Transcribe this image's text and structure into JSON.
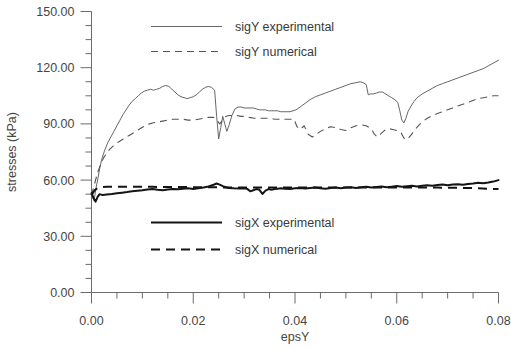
{
  "chart_data": {
    "type": "line",
    "title": "",
    "xlabel": "epsY",
    "ylabel": "stresses (kPa)",
    "xlim": [
      0.0,
      0.08
    ],
    "ylim": [
      0.0,
      150.0
    ],
    "grid": false,
    "legend_position": "inside-upper-left and inside-middle-left",
    "xticks": [
      "0.00",
      "0.02",
      "0.04",
      "0.06",
      "0.08"
    ],
    "xtick_values": [
      0.0,
      0.02,
      0.04,
      0.06,
      0.08
    ],
    "xminor_interval": 0.005,
    "yticks": [
      "0.00",
      "30.00",
      "60.00",
      "90.00",
      "120.00",
      "150.00"
    ],
    "ytick_values": [
      0,
      30,
      60,
      90,
      120,
      150
    ],
    "yminor_interval": 7.5,
    "series": [
      {
        "name": "sigY experimental",
        "style": "solid-thin",
        "x": [
          0.0,
          0.0005,
          0.0009,
          0.0012,
          0.0016,
          0.002,
          0.0026,
          0.0032,
          0.0038,
          0.0044,
          0.005,
          0.0056,
          0.0062,
          0.0068,
          0.0074,
          0.008,
          0.0086,
          0.0092,
          0.0098,
          0.0104,
          0.011,
          0.0116,
          0.0122,
          0.0128,
          0.0134,
          0.014,
          0.0146,
          0.0152,
          0.0158,
          0.0164,
          0.017,
          0.0176,
          0.0182,
          0.0188,
          0.0194,
          0.02,
          0.0206,
          0.0212,
          0.0218,
          0.0224,
          0.023,
          0.0236,
          0.0242,
          0.0246,
          0.025,
          0.0254,
          0.0258,
          0.0262,
          0.0266,
          0.027,
          0.0276,
          0.0282,
          0.0288,
          0.0294,
          0.03,
          0.0306,
          0.0312,
          0.0318,
          0.0324,
          0.033,
          0.0336,
          0.0342,
          0.0348,
          0.0354,
          0.036,
          0.0366,
          0.0372,
          0.0378,
          0.0384,
          0.039,
          0.0396,
          0.0402,
          0.041,
          0.042,
          0.043,
          0.044,
          0.045,
          0.046,
          0.047,
          0.048,
          0.049,
          0.05,
          0.051,
          0.052,
          0.0528,
          0.0534,
          0.054,
          0.0544,
          0.0548,
          0.0554,
          0.056,
          0.0566,
          0.0572,
          0.0578,
          0.0584,
          0.059,
          0.0596,
          0.0602,
          0.0606,
          0.061,
          0.0614,
          0.0618,
          0.0622,
          0.0628,
          0.0634,
          0.064,
          0.065,
          0.066,
          0.067,
          0.068,
          0.069,
          0.07,
          0.071,
          0.072,
          0.073,
          0.074,
          0.075,
          0.076,
          0.077,
          0.078,
          0.079,
          0.08
        ],
        "y": [
          52.0,
          49.0,
          56.0,
          60.0,
          66.0,
          71.0,
          76.0,
          80.0,
          83.0,
          86.0,
          89.0,
          92.0,
          95.0,
          97.5,
          100.0,
          102.0,
          103.5,
          105.0,
          106.5,
          107.5,
          108.0,
          108.5,
          108.0,
          108.5,
          109.0,
          110.0,
          110.5,
          110.0,
          108.5,
          107.0,
          105.5,
          104.5,
          104.0,
          103.5,
          104.0,
          104.5,
          105.5,
          107.0,
          108.5,
          109.5,
          110.0,
          109.5,
          108.0,
          94.0,
          82.0,
          88.0,
          94.0,
          90.0,
          86.0,
          89.0,
          94.5,
          98.0,
          99.0,
          99.0,
          98.5,
          98.5,
          98.5,
          98.5,
          98.0,
          97.5,
          97.5,
          97.5,
          97.0,
          97.0,
          97.0,
          97.0,
          96.5,
          96.5,
          96.5,
          96.5,
          97.0,
          97.5,
          99.0,
          101.0,
          103.0,
          104.5,
          105.5,
          106.5,
          107.5,
          108.5,
          109.5,
          110.5,
          111.5,
          112.0,
          112.5,
          112.0,
          111.0,
          105.5,
          106.0,
          106.0,
          106.5,
          107.0,
          107.0,
          106.0,
          105.0,
          104.0,
          103.0,
          101.5,
          97.0,
          92.0,
          90.5,
          93.0,
          96.5,
          99.5,
          102.0,
          104.0,
          106.0,
          107.5,
          109.0,
          110.5,
          111.5,
          112.5,
          113.5,
          114.5,
          115.5,
          116.5,
          117.5,
          118.5,
          119.5,
          121.0,
          122.5,
          124.0
        ]
      },
      {
        "name": "sigY numerical",
        "style": "dashed-thin",
        "x": [
          0.0,
          0.0006,
          0.0012,
          0.0018,
          0.0024,
          0.003,
          0.0036,
          0.0042,
          0.0048,
          0.0054,
          0.006,
          0.0066,
          0.0072,
          0.0078,
          0.0084,
          0.009,
          0.0096,
          0.0102,
          0.0108,
          0.0114,
          0.012,
          0.013,
          0.014,
          0.015,
          0.016,
          0.017,
          0.018,
          0.019,
          0.02,
          0.021,
          0.022,
          0.023,
          0.024,
          0.0246,
          0.0252,
          0.0258,
          0.0264,
          0.027,
          0.0278,
          0.0286,
          0.0294,
          0.0302,
          0.031,
          0.032,
          0.033,
          0.034,
          0.035,
          0.036,
          0.037,
          0.038,
          0.039,
          0.0398,
          0.0404,
          0.041,
          0.0418,
          0.0426,
          0.0434,
          0.0442,
          0.045,
          0.046,
          0.047,
          0.048,
          0.049,
          0.05,
          0.051,
          0.052,
          0.053,
          0.054,
          0.055,
          0.0556,
          0.0562,
          0.0568,
          0.0576,
          0.0584,
          0.0592,
          0.06,
          0.0608,
          0.0614,
          0.062,
          0.0628,
          0.0636,
          0.0644,
          0.0652,
          0.066,
          0.067,
          0.068,
          0.069,
          0.07,
          0.071,
          0.072,
          0.073,
          0.074,
          0.075,
          0.076,
          0.077,
          0.078,
          0.079,
          0.08
        ],
        "y": [
          52.0,
          58.0,
          64.0,
          68.5,
          72.0,
          74.5,
          76.5,
          78.0,
          79.5,
          80.5,
          81.5,
          82.5,
          83.5,
          84.5,
          85.5,
          86.5,
          87.5,
          88.5,
          89.5,
          90.0,
          90.5,
          91.0,
          91.5,
          92.0,
          92.5,
          92.5,
          92.5,
          92.0,
          92.0,
          92.5,
          93.0,
          93.5,
          93.5,
          92.0,
          90.0,
          92.0,
          94.0,
          94.5,
          94.5,
          94.5,
          94.0,
          94.0,
          93.5,
          93.0,
          93.0,
          93.0,
          93.0,
          92.5,
          92.5,
          92.5,
          92.5,
          92.5,
          88.5,
          87.0,
          89.0,
          84.5,
          83.0,
          84.5,
          86.0,
          87.5,
          88.5,
          88.0,
          87.0,
          86.5,
          88.0,
          89.0,
          89.5,
          89.0,
          87.5,
          84.5,
          83.0,
          84.5,
          86.5,
          87.5,
          87.0,
          86.5,
          85.5,
          82.5,
          81.5,
          84.0,
          87.0,
          89.5,
          91.5,
          93.0,
          94.5,
          95.5,
          96.5,
          97.5,
          98.5,
          99.5,
          100.5,
          101.5,
          102.5,
          103.5,
          104.0,
          104.5,
          105.0,
          105.0
        ]
      },
      {
        "name": "sigX experimental",
        "style": "solid-thick",
        "x": [
          0.0,
          0.0004,
          0.0008,
          0.0012,
          0.0016,
          0.0022,
          0.003,
          0.004,
          0.005,
          0.006,
          0.007,
          0.008,
          0.009,
          0.01,
          0.011,
          0.012,
          0.013,
          0.014,
          0.015,
          0.016,
          0.017,
          0.018,
          0.019,
          0.02,
          0.021,
          0.022,
          0.023,
          0.024,
          0.0246,
          0.0252,
          0.0258,
          0.0264,
          0.027,
          0.028,
          0.029,
          0.03,
          0.0306,
          0.0312,
          0.0318,
          0.0324,
          0.033,
          0.0336,
          0.0342,
          0.0348,
          0.0354,
          0.036,
          0.0366,
          0.0372,
          0.038,
          0.039,
          0.04,
          0.041,
          0.042,
          0.043,
          0.044,
          0.045,
          0.046,
          0.047,
          0.048,
          0.049,
          0.05,
          0.051,
          0.052,
          0.053,
          0.054,
          0.055,
          0.056,
          0.057,
          0.058,
          0.059,
          0.06,
          0.061,
          0.062,
          0.063,
          0.064,
          0.065,
          0.066,
          0.067,
          0.068,
          0.069,
          0.07,
          0.071,
          0.072,
          0.073,
          0.074,
          0.075,
          0.076,
          0.077,
          0.078,
          0.079,
          0.08
        ],
        "y": [
          53.0,
          50.5,
          48.5,
          51.0,
          52.5,
          52.0,
          52.3,
          52.6,
          53.0,
          53.3,
          53.6,
          54.0,
          54.3,
          54.6,
          55.0,
          55.2,
          54.8,
          54.6,
          55.0,
          55.3,
          55.1,
          55.4,
          55.6,
          55.3,
          55.6,
          56.0,
          56.6,
          57.5,
          58.2,
          57.6,
          56.8,
          56.2,
          55.8,
          55.6,
          55.5,
          55.7,
          55.3,
          54.0,
          54.6,
          55.2,
          54.8,
          52.6,
          54.4,
          55.2,
          54.9,
          55.2,
          55.4,
          55.6,
          55.4,
          55.2,
          55.6,
          55.8,
          55.5,
          55.8,
          56.0,
          55.6,
          55.4,
          55.8,
          56.0,
          55.7,
          56.0,
          56.2,
          55.8,
          56.2,
          56.4,
          56.0,
          56.3,
          56.6,
          56.2,
          56.5,
          56.8,
          56.4,
          56.7,
          57.0,
          56.6,
          57.0,
          57.3,
          57.0,
          57.4,
          57.6,
          57.2,
          57.6,
          57.8,
          57.5,
          57.9,
          58.2,
          58.6,
          58.3,
          58.7,
          59.2,
          60.0
        ]
      },
      {
        "name": "sigX numerical",
        "style": "dashed-thick",
        "x": [
          0.0,
          0.0006,
          0.0012,
          0.002,
          0.003,
          0.004,
          0.006,
          0.008,
          0.01,
          0.012,
          0.014,
          0.016,
          0.018,
          0.02,
          0.022,
          0.024,
          0.026,
          0.028,
          0.03,
          0.032,
          0.034,
          0.036,
          0.038,
          0.04,
          0.042,
          0.044,
          0.046,
          0.048,
          0.05,
          0.052,
          0.054,
          0.056,
          0.058,
          0.06,
          0.062,
          0.064,
          0.066,
          0.068,
          0.07,
          0.072,
          0.074,
          0.076,
          0.078,
          0.08
        ],
        "y": [
          52.0,
          54.5,
          55.8,
          56.2,
          56.4,
          56.4,
          56.4,
          56.4,
          56.4,
          56.4,
          56.3,
          56.3,
          56.3,
          56.2,
          56.2,
          56.2,
          56.1,
          56.1,
          56.1,
          56.0,
          56.0,
          56.0,
          56.0,
          56.0,
          56.0,
          56.0,
          56.0,
          56.0,
          56.0,
          56.0,
          56.0,
          56.0,
          56.0,
          56.0,
          56.0,
          56.0,
          56.0,
          56.0,
          55.9,
          55.9,
          55.8,
          55.6,
          55.4,
          55.2
        ]
      }
    ]
  },
  "legend": {
    "upper": [
      {
        "label": "sigY experimental",
        "style": "solid-thin"
      },
      {
        "label": "sigY numerical",
        "style": "dashed-thin"
      }
    ],
    "lower": [
      {
        "label": "sigX experimental",
        "style": "solid-thick"
      },
      {
        "label": "sigX numerical",
        "style": "dashed-thick"
      }
    ]
  },
  "colors": {
    "background": "#ffffff",
    "axis": "#6b6b6b",
    "text": "#454545",
    "sigY_line": "#555555",
    "sigX_line": "#141414"
  }
}
